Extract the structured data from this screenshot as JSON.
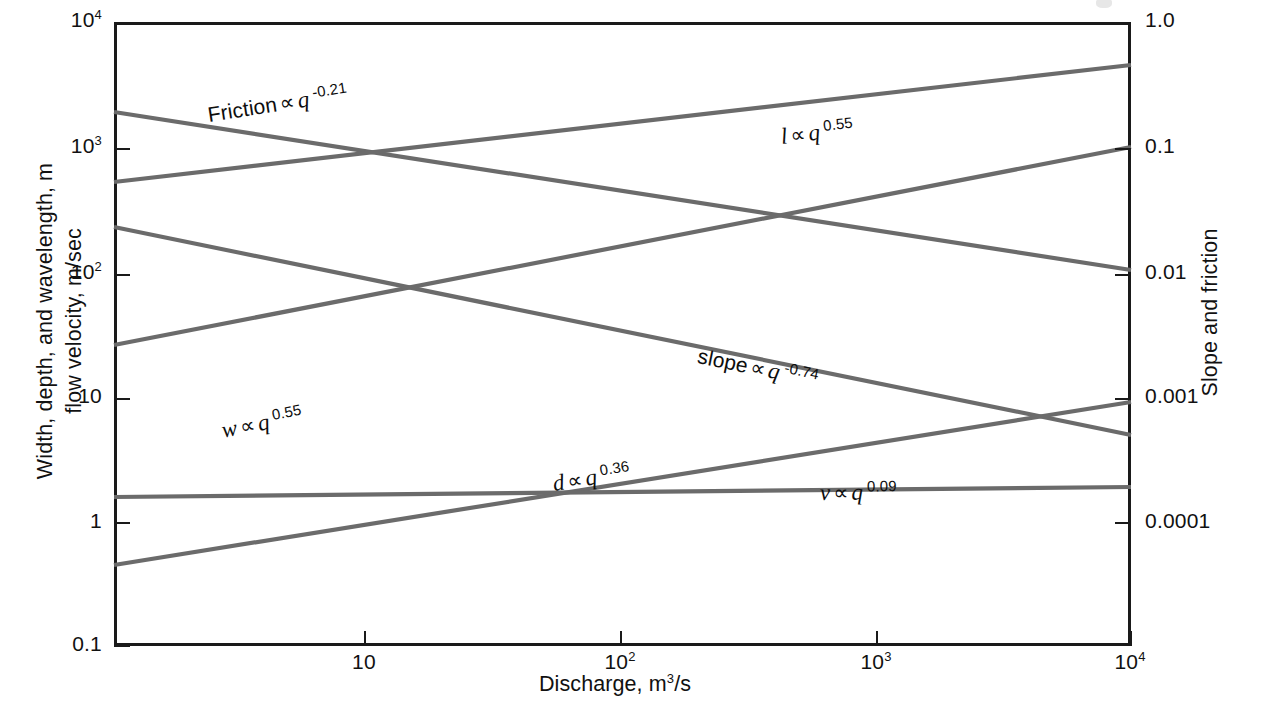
{
  "chart_data": {
    "type": "line",
    "title": "",
    "subtitle": "",
    "xlabel": "Discharge, m3/s",
    "xlabel_parts": {
      "text": "Discharge, m",
      "sup": "3",
      "tail": "/s"
    },
    "ylabel": "Width, depth, and wavelength, m / flow velocity, m/sec",
    "ylabel_lines": [
      "Width, depth, and wavelength, m",
      "flow velocity, m/sec"
    ],
    "ylabel_right": "Slope and friction",
    "xscale": "log",
    "yscale": "log",
    "y2scale": "log",
    "xlim": [
      1.5,
      10000
    ],
    "ylim": [
      0.1,
      10000
    ],
    "y2lim": [
      3e-05,
      1.0
    ],
    "grid": false,
    "legend": "none (inline annotations on each line)",
    "xticks": [
      {
        "value": 10,
        "label_base": "10",
        "label_exp": ""
      },
      {
        "value": 100,
        "label_base": "10",
        "label_exp": "2"
      },
      {
        "value": 1000,
        "label_base": "10",
        "label_exp": "3"
      },
      {
        "value": 10000,
        "label_base": "10",
        "label_exp": "4"
      }
    ],
    "yticks_left": [
      {
        "value": 10000,
        "label_base": "10",
        "label_exp": "4"
      },
      {
        "value": 1000,
        "label_base": "10",
        "label_exp": "3"
      },
      {
        "value": 100,
        "label_base": "10",
        "label_exp": "2"
      },
      {
        "value": 10,
        "label_base": "10",
        "label_exp": ""
      },
      {
        "value": 1,
        "label_base": "1",
        "label_exp": ""
      },
      {
        "value": 0.1,
        "label_base": "0.1",
        "label_exp": ""
      }
    ],
    "yticks_right": [
      {
        "value": 1.0,
        "label": "1.0"
      },
      {
        "value": 0.1,
        "label": "0.1"
      },
      {
        "value": 0.01,
        "label": "0.01"
      },
      {
        "value": 0.001,
        "label": "0.001"
      },
      {
        "value": 0.0001,
        "label": "0.0001"
      }
    ],
    "line_color": "#6b6b6b",
    "axis_color": "#1a1a1a",
    "series": [
      {
        "name": "friction",
        "label_symbol": "Friction",
        "label_prop": "∝",
        "label_var": "q",
        "exponent": "-0.21",
        "axis": "right",
        "x": [
          1.5,
          10000
        ],
        "y": [
          0.3,
          0.04
        ],
        "px": [
          [
            114,
            112
          ],
          [
            1131,
            270
          ]
        ]
      },
      {
        "name": "wavelength",
        "label_symbol": "l",
        "label_prop": "∝",
        "label_var": "q",
        "exponent": "0.55",
        "axis": "left",
        "x": [
          1.5,
          10000
        ],
        "y": [
          400,
          5500
        ],
        "px": [
          [
            114,
            182
          ],
          [
            1131,
            65
          ]
        ]
      },
      {
        "name": "width",
        "label_symbol": "w",
        "label_prop": "∝",
        "label_var": "q",
        "exponent": "0.55",
        "axis": "left",
        "x": [
          1.5,
          10000
        ],
        "y": [
          32,
          500
        ],
        "px": [
          [
            114,
            345
          ],
          [
            1131,
            147
          ]
        ]
      },
      {
        "name": "slope",
        "label_symbol": "slope",
        "label_prop": "∝",
        "label_var": "q",
        "exponent": "-0.74",
        "axis": "right",
        "x": [
          1.5,
          10000
        ],
        "y": [
          0.055,
          0.00048
        ],
        "px": [
          [
            114,
            227
          ],
          [
            1131,
            435
          ]
        ]
      },
      {
        "name": "depth",
        "label_symbol": "d",
        "label_prop": "∝",
        "label_var": "q",
        "exponent": "0.36",
        "axis": "left",
        "x": [
          1.5,
          10000
        ],
        "y": [
          0.45,
          10
        ],
        "px": [
          [
            114,
            565
          ],
          [
            1131,
            402
          ]
        ]
      },
      {
        "name": "velocity",
        "label_symbol": "v",
        "label_prop": "∝",
        "label_var": "q",
        "exponent": "0.09",
        "axis": "left",
        "x": [
          1.5,
          10000
        ],
        "y": [
          1.42,
          1.8
        ],
        "px": [
          [
            114,
            497
          ],
          [
            1131,
            487
          ]
        ]
      }
    ],
    "annotations": [
      {
        "for": "friction",
        "text": "Friction ∝ q -0.21",
        "px": [
          208,
          102
        ],
        "rotate": -8.8
      },
      {
        "for": "wavelength",
        "text": "l ∝ q 0.55",
        "px": [
          781,
          124
        ],
        "rotate": -6.6
      },
      {
        "for": "width",
        "text": "w ∝ q 0.55",
        "px": [
          222,
          418
        ],
        "rotate": -11.0
      },
      {
        "for": "slope",
        "text": "slope ∝ q -0.74",
        "px": [
          698,
          343
        ],
        "rotate": 11.6
      },
      {
        "for": "depth",
        "text": "d ∝ q 0.36",
        "px": [
          553,
          471
        ],
        "rotate": -9.0
      },
      {
        "for": "velocity",
        "text": "v ∝ q 0.09",
        "px": [
          820,
          480
        ],
        "rotate": -0.6
      }
    ]
  },
  "icons": {
    "proportional": "∝"
  }
}
